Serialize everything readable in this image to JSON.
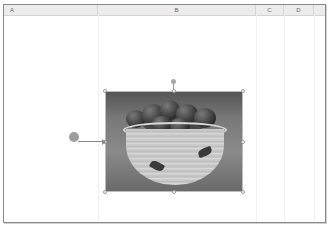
{
  "sheet": {
    "columns": [
      {
        "label": "A",
        "left": 0,
        "width": 94
      },
      {
        "label": "B",
        "left": 94,
        "width": 158
      },
      {
        "label": "C",
        "left": 252,
        "width": 28
      },
      {
        "label": "D",
        "left": 280,
        "width": 30
      }
    ]
  },
  "picture": {
    "description": "Grayscale photo of a ceramic bowl filled with tomatoes",
    "selected": true
  },
  "callout": {
    "marker": "callout-marker",
    "color": "#9e9e9e"
  }
}
